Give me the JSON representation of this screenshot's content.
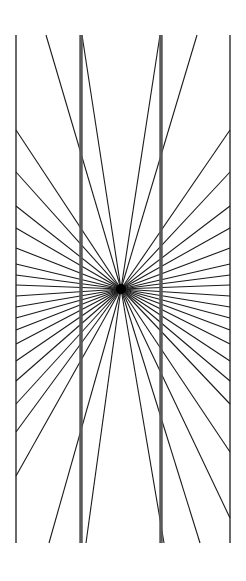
{
  "figure": {
    "type": "hering-illusion",
    "colors": {
      "background": "#ffffff",
      "rays": "#1a1a1a",
      "frame": "#1a1a1a",
      "bars": "#5a5a5a"
    },
    "center": [
      121,
      289
    ],
    "frame": {
      "left": 16,
      "right": 230,
      "top": 35,
      "bottom": 543
    },
    "bars": [
      {
        "x": 81,
        "width": 3.5
      },
      {
        "x": 161,
        "width": 3.5
      }
    ],
    "left_ray_y": [
      130,
      172,
      206,
      228,
      248,
      264,
      275,
      285,
      296,
      307,
      318,
      330,
      344,
      361,
      381,
      404,
      432,
      476
    ],
    "right_ray_y": [
      130,
      172,
      206,
      228,
      248,
      264,
      275,
      285,
      296,
      307,
      318,
      330,
      344,
      361,
      381,
      404,
      452,
      518
    ],
    "top_ray_x": [
      16,
      46,
      82,
      160,
      197,
      230
    ],
    "bottom_ray_x": [
      49,
      86,
      164,
      200,
      16,
      230
    ]
  }
}
